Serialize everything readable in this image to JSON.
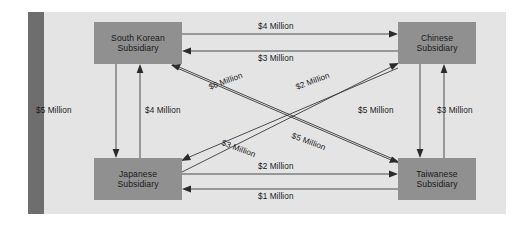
{
  "diagram": {
    "panel_color": "#e4e4e4",
    "node_color": "#909090",
    "bar_color": "#6e6e6e",
    "nodes": [
      {
        "id": "south-korean",
        "line1": "South Korean",
        "line2": "Subsidiary"
      },
      {
        "id": "chinese",
        "line1": "Chinese",
        "line2": "Subsidiary"
      },
      {
        "id": "japanese",
        "line1": "Japanese",
        "line2": "Subsidiary"
      },
      {
        "id": "taiwanese",
        "line1": "Taiwanese",
        "line2": "Subsidiary"
      }
    ],
    "edges": [
      {
        "id": "sk-to-cn",
        "from": "South Korean Subsidiary",
        "to": "Chinese Subsidiary",
        "label": "$4 Million",
        "amount": 4
      },
      {
        "id": "cn-to-sk",
        "from": "Chinese Subsidiary",
        "to": "South Korean Subsidiary",
        "label": "$3 Million",
        "amount": 3
      },
      {
        "id": "sk-to-jp",
        "from": "South Korean Subsidiary",
        "to": "Japanese Subsidiary",
        "label": "$5 Million",
        "amount": 5
      },
      {
        "id": "jp-to-sk",
        "from": "Japanese Subsidiary",
        "to": "South Korean Subsidiary",
        "label": "$4 Million",
        "amount": 4
      },
      {
        "id": "cn-to-tw",
        "from": "Chinese Subsidiary",
        "to": "Taiwanese Subsidiary",
        "label": "$5 Million",
        "amount": 5
      },
      {
        "id": "tw-to-cn",
        "from": "Taiwanese Subsidiary",
        "to": "Chinese Subsidiary",
        "label": "$3 Million",
        "amount": 3
      },
      {
        "id": "jp-to-tw",
        "from": "Japanese Subsidiary",
        "to": "Taiwanese Subsidiary",
        "label": "$2 Million",
        "amount": 2
      },
      {
        "id": "tw-to-jp",
        "from": "Taiwanese Subsidiary",
        "to": "Japanese Subsidiary",
        "label": "$1 Million",
        "amount": 1
      },
      {
        "id": "tw-to-sk",
        "from": "Taiwanese Subsidiary",
        "to": "South Korean Subsidiary",
        "label": "$6 Million",
        "amount": 6
      },
      {
        "id": "jp-to-cn",
        "from": "Japanese Subsidiary",
        "to": "Chinese Subsidiary",
        "label": "$2 Million",
        "amount": 2
      },
      {
        "id": "sk-to-tw",
        "from": "South Korean Subsidiary",
        "to": "Taiwanese Subsidiary",
        "label": "$3 Million",
        "amount": 3
      },
      {
        "id": "cn-to-jp",
        "from": "Chinese Subsidiary",
        "to": "Japanese Subsidiary",
        "label": "$5 Million",
        "amount": 5
      }
    ]
  }
}
